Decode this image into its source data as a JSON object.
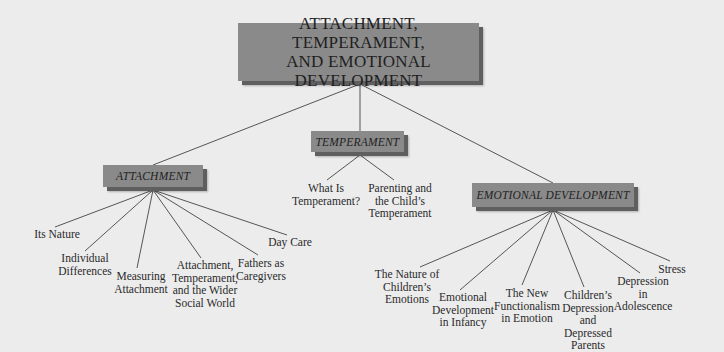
{
  "diagram": {
    "title": "ATTACHMENT, TEMPERAMENT,\nAND EMOTIONAL DEVELOPMENT",
    "colors": {
      "background": "#ececec",
      "box_face": "#8a8a8a",
      "box_edge": "#5f5f5f",
      "line": "#555555",
      "text": "#1f1f1f"
    },
    "branches": [
      {
        "label": "ATTACHMENT",
        "children": [
          "Its Nature",
          "Individual\nDifferences",
          "Measuring\nAttachment",
          "Attachment,\nTemperament,\nand the Wider\nSocial World",
          "Fathers as\nCaregivers",
          "Day Care"
        ]
      },
      {
        "label": "TEMPERAMENT",
        "children": [
          "What Is\nTemperament?",
          "Parenting and\nthe Child’s\nTemperament"
        ]
      },
      {
        "label": "EMOTIONAL DEVELOPMENT",
        "children": [
          "The Nature of\nChildren’s\nEmotions",
          "Emotional\nDevelopment\nin Infancy",
          "The New\nFunctionalism\nin Emotion",
          "Children’s\nDepression\nand Depressed\nParents",
          "Depression in\nAdolescence",
          "Stress"
        ]
      }
    ]
  }
}
